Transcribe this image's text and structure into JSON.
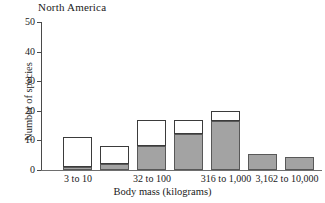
{
  "chart_data": {
    "type": "bar",
    "title": "North America",
    "xlabel": "Body mass (kilograms)",
    "ylabel": "Number of species",
    "ylim": [
      0,
      50
    ],
    "yticks": [
      0,
      10,
      20,
      30,
      40,
      50
    ],
    "grid": false,
    "legend": null,
    "stacked": true,
    "bar_count": 7,
    "categories": [
      "3 to 10",
      "",
      "32 to 100",
      "",
      "316 to 1,000",
      "",
      "3,162 to 10,000"
    ],
    "xtick_labels": [
      "3 to 10",
      "32 to 100",
      "316 to 1,000",
      "3,162 to 10,000"
    ],
    "xtick_bar_indices": [
      0,
      2,
      4,
      6
    ],
    "series": [
      {
        "name": "lower-segment",
        "color": "#a3a3a3",
        "values": [
          1,
          2,
          8,
          12,
          16.5,
          5.5,
          4.5
        ]
      },
      {
        "name": "upper-segment",
        "color": "#ffffff",
        "values": [
          10,
          6,
          9,
          5,
          3.5,
          0,
          0
        ]
      }
    ],
    "totals": [
      11,
      8,
      17,
      17,
      20,
      5.5,
      4.5
    ],
    "bars": [
      {
        "index": 0,
        "total": 11,
        "lower": 1,
        "upper": 10,
        "label": "3 to 10"
      },
      {
        "index": 1,
        "total": 8,
        "lower": 2,
        "upper": 6,
        "label": ""
      },
      {
        "index": 2,
        "total": 17,
        "lower": 8,
        "upper": 9,
        "label": "32 to 100"
      },
      {
        "index": 3,
        "total": 17,
        "lower": 12,
        "upper": 5,
        "label": ""
      },
      {
        "index": 4,
        "total": 20,
        "lower": 16.5,
        "upper": 3.5,
        "label": "316 to 1,000"
      },
      {
        "index": 5,
        "total": 5.5,
        "lower": 5.5,
        "upper": 0,
        "label": ""
      },
      {
        "index": 6,
        "total": 4.5,
        "lower": 4.5,
        "upper": 0,
        "label": "3,162 to 10,000"
      }
    ]
  },
  "yticks": {
    "t0": "0",
    "t10": "10",
    "t20": "20",
    "t30": "30",
    "t40": "40",
    "t50": "50"
  },
  "xticks": {
    "x1": "3 to 10",
    "x2": "32 to 100",
    "x3": "316 to 1,000",
    "x4": "3,162 to 10,000"
  },
  "labels": {
    "title": "North America",
    "ylabel": "Number of species",
    "xlabel": "Body mass (kilograms)"
  }
}
